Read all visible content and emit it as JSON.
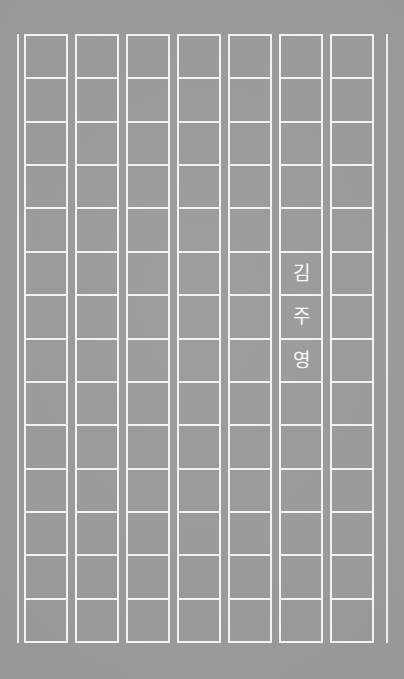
{
  "page": {
    "kind": "korean-manuscript-paper-cover",
    "width": 404,
    "height": 679,
    "background_color": "#999a97",
    "rule_color": "#f2f2f0",
    "text_color": "#fbfbfa"
  },
  "grid": {
    "column_count": 7,
    "rows_per_column": 14,
    "first_column_left": 24,
    "column_width": 44,
    "column_pitch": 51,
    "grid_top": 34,
    "grid_bottom": 643,
    "row_pitch": 43.5,
    "left_edge_rule_x": 17,
    "right_edge_rule_x": 386
  },
  "author": {
    "full_name": "김주영",
    "column_index": 5,
    "start_row_index": 5,
    "characters": [
      {
        "char": "김",
        "row": 5
      },
      {
        "char": "주",
        "row": 6
      },
      {
        "char": "영",
        "row": 7
      }
    ]
  },
  "columns": [
    {
      "index": 0,
      "label": "manuscript-column-1",
      "cells": [
        "",
        "",
        "",
        "",
        "",
        "",
        "",
        "",
        "",
        "",
        "",
        "",
        "",
        ""
      ]
    },
    {
      "index": 1,
      "label": "manuscript-column-2",
      "cells": [
        "",
        "",
        "",
        "",
        "",
        "",
        "",
        "",
        "",
        "",
        "",
        "",
        "",
        ""
      ]
    },
    {
      "index": 2,
      "label": "manuscript-column-3",
      "cells": [
        "",
        "",
        "",
        "",
        "",
        "",
        "",
        "",
        "",
        "",
        "",
        "",
        "",
        ""
      ]
    },
    {
      "index": 3,
      "label": "manuscript-column-4",
      "cells": [
        "",
        "",
        "",
        "",
        "",
        "",
        "",
        "",
        "",
        "",
        "",
        "",
        "",
        ""
      ]
    },
    {
      "index": 4,
      "label": "manuscript-column-5",
      "cells": [
        "",
        "",
        "",
        "",
        "",
        "",
        "",
        "",
        "",
        "",
        "",
        "",
        "",
        ""
      ]
    },
    {
      "index": 5,
      "label": "manuscript-column-6",
      "cells": [
        "",
        "",
        "",
        "",
        "",
        "김",
        "주",
        "영",
        "",
        "",
        "",
        "",
        "",
        ""
      ]
    },
    {
      "index": 6,
      "label": "manuscript-column-7",
      "cells": [
        "",
        "",
        "",
        "",
        "",
        "",
        "",
        "",
        "",
        "",
        "",
        "",
        "",
        ""
      ]
    }
  ]
}
